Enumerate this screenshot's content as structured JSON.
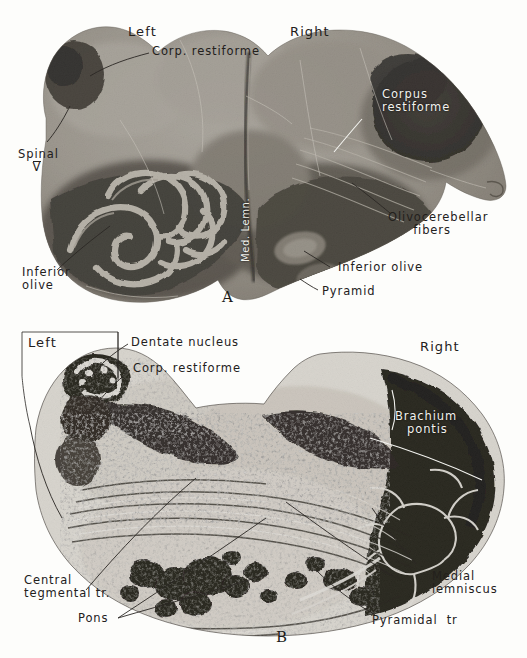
{
  "plate": {
    "title": "Brainstem transverse sections",
    "background_color": "#fdfdfb",
    "ink_color": "#23201c",
    "white_ink_color": "#f2f2ee"
  },
  "panel_a": {
    "letter": "A",
    "orientation_left": "Left",
    "orientation_right": "Right",
    "labels": [
      {
        "id": "corp-restiforme-left",
        "text": "Corp. restiforme",
        "color": "dark"
      },
      {
        "id": "spinal-v",
        "text": "Spinal",
        "text2": "V",
        "color": "dark"
      },
      {
        "id": "inferior-olive-left",
        "text": "Inferior",
        "text2": "olive",
        "color": "dark"
      },
      {
        "id": "med-lemn",
        "text": "Med. Lemn.",
        "color": "white"
      },
      {
        "id": "corpus-restiforme-right",
        "text": "Corpus",
        "text2": "restiforme",
        "color": "white"
      },
      {
        "id": "olivocerebellar-fibers",
        "text": "Olivocerebellar",
        "text2": "fibers",
        "color": "dark"
      },
      {
        "id": "inferior-olive-right",
        "text": "Inferior olive",
        "color": "dark"
      },
      {
        "id": "pyramid",
        "text": "Pyramid",
        "color": "dark"
      }
    ]
  },
  "panel_b": {
    "letter": "B",
    "orientation_left": "Left",
    "orientation_right": "Right",
    "labels": [
      {
        "id": "dentate-nucleus",
        "text": "Dentate nucleus",
        "color": "dark"
      },
      {
        "id": "corp-restiforme-b",
        "text": "Corp. restiforme",
        "color": "dark"
      },
      {
        "id": "brachium-pontis",
        "text": "Brachium",
        "text2": "pontis",
        "color": "white"
      },
      {
        "id": "central-tegmental-tr",
        "text": "Central",
        "text2": "tegmental tr.",
        "color": "dark"
      },
      {
        "id": "pons",
        "text": "Pons",
        "color": "dark"
      },
      {
        "id": "medial-lemniscus",
        "text": "Medial",
        "text2": "lemniscus",
        "color": "dark"
      },
      {
        "id": "pyramidal-tr",
        "text": "Pyramidal  tr",
        "color": "dark"
      }
    ]
  }
}
